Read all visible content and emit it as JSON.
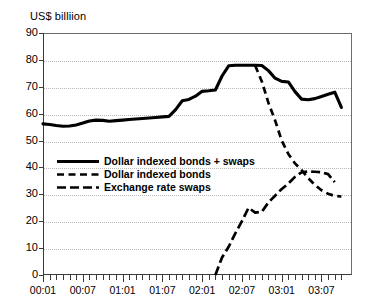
{
  "chart_data": {
    "type": "line",
    "title": "US$ billiion",
    "xlabel": "",
    "ylabel": "US$ billiion",
    "ylim": [
      0,
      90
    ],
    "ytick_step": 10,
    "yticks": [
      "0",
      "10",
      "20",
      "30",
      "40",
      "50",
      "60",
      "70",
      "80",
      "90"
    ],
    "grid": true,
    "legend_position": "center-left",
    "x_tick_labels": [
      "00:01",
      "00:07",
      "01:01",
      "01:07",
      "02:01",
      "02:07",
      "03:01",
      "03:07"
    ],
    "x_minor_ticks_per_label": 6,
    "x": [
      "00:01",
      "00:02",
      "00:03",
      "00:04",
      "00:05",
      "00:06",
      "00:07",
      "00:08",
      "00:09",
      "00:10",
      "00:11",
      "00:12",
      "01:01",
      "01:02",
      "01:03",
      "01:04",
      "01:05",
      "01:06",
      "01:07",
      "01:08",
      "01:09",
      "01:10",
      "01:11",
      "01:12",
      "02:01",
      "02:02",
      "02:03",
      "02:04",
      "02:05",
      "02:06",
      "02:07",
      "02:08",
      "02:09",
      "02:10",
      "02:11",
      "02:12",
      "03:01",
      "03:02",
      "03:03",
      "03:04",
      "03:05",
      "03:06",
      "03:07",
      "03:08",
      "03:09",
      "03:10"
    ],
    "series": [
      {
        "name": "Dollar indexed bonds + swaps",
        "style": "solid",
        "values": [
          56.2,
          56.0,
          55.6,
          55.3,
          55.4,
          55.8,
          56.5,
          57.3,
          57.6,
          57.5,
          57.2,
          57.4,
          57.6,
          57.8,
          58.0,
          58.2,
          58.4,
          58.6,
          58.8,
          59.0,
          61.5,
          64.8,
          65.3,
          66.5,
          68.3,
          68.5,
          68.8,
          74.0,
          77.8,
          78.0,
          78.0,
          78.0,
          78.0,
          77.9,
          76.0,
          73.2,
          72.0,
          71.8,
          68.2,
          65.4,
          65.2,
          65.6,
          66.4,
          67.2,
          68.0,
          62.3
        ]
      },
      {
        "name": "Dollar indexed bonds",
        "style": "dashed",
        "values": [
          null,
          null,
          null,
          null,
          null,
          null,
          null,
          null,
          null,
          null,
          null,
          null,
          null,
          null,
          null,
          null,
          null,
          null,
          null,
          null,
          null,
          null,
          null,
          null,
          null,
          null,
          null,
          null,
          null,
          null,
          null,
          null,
          77.9,
          72.0,
          64.0,
          57.5,
          50.0,
          45.0,
          41.5,
          39.0,
          36.0,
          33.5,
          31.5,
          30.2,
          29.4,
          29.2
        ]
      },
      {
        "name": "Exchange rate swaps",
        "style": "dash-dot",
        "values": [
          null,
          null,
          null,
          null,
          null,
          null,
          null,
          null,
          null,
          null,
          null,
          null,
          null,
          null,
          null,
          null,
          null,
          null,
          null,
          null,
          null,
          null,
          null,
          null,
          null,
          null,
          null,
          null,
          null,
          null,
          null,
          null,
          null,
          null,
          null,
          null,
          null,
          null,
          null,
          null,
          null,
          null,
          null,
          null,
          null,
          null
        ],
        "x_start": "02:03",
        "points": [
          {
            "x": "02:03",
            "y": 0.0
          },
          {
            "x": "02:04",
            "y": 6.5
          },
          {
            "x": "02:05",
            "y": 10.5
          },
          {
            "x": "02:06",
            "y": 15.5
          },
          {
            "x": "02:07",
            "y": 20.0
          },
          {
            "x": "02:08",
            "y": 25.0
          },
          {
            "x": "02:09",
            "y": 23.2
          },
          {
            "x": "02:10",
            "y": 23.5
          },
          {
            "x": "02:11",
            "y": 27.0
          },
          {
            "x": "02:12",
            "y": 29.5
          },
          {
            "x": "03:01",
            "y": 32.0
          },
          {
            "x": "03:02",
            "y": 34.0
          },
          {
            "x": "03:03",
            "y": 36.5
          },
          {
            "x": "03:04",
            "y": 38.2
          },
          {
            "x": "03:05",
            "y": 38.5
          },
          {
            "x": "03:06",
            "y": 38.4
          },
          {
            "x": "03:07",
            "y": 38.2
          },
          {
            "x": "03:08",
            "y": 37.5
          },
          {
            "x": "03:09",
            "y": 34.5
          }
        ]
      }
    ],
    "legend": [
      {
        "label": "Dollar indexed bonds + swaps",
        "style": "solid"
      },
      {
        "label": "Dollar indexed bonds",
        "style": "dashed"
      },
      {
        "label": "Exchange rate swaps",
        "style": "dash-dot"
      }
    ]
  }
}
